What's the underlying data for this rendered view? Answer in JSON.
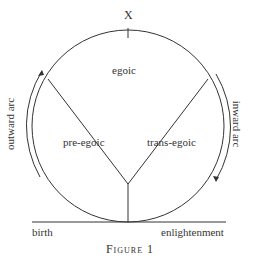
{
  "diagram": {
    "top_mark": "X",
    "segments": {
      "top": "egoic",
      "left": "pre-egoic",
      "right": "trans-egoic"
    },
    "arcs": {
      "left": "outward arc",
      "right": "inward arc"
    },
    "baseline": {
      "left": "birth",
      "right": "enlightenment"
    },
    "caption": "Figure 1"
  }
}
